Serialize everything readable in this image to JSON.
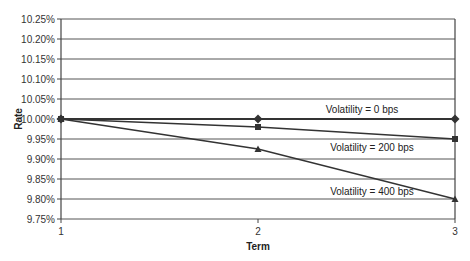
{
  "chart_data": {
    "type": "line",
    "title": "",
    "xlabel": "Term",
    "ylabel": "Rate",
    "x": [
      1,
      2,
      3
    ],
    "x_tick_labels": [
      "1",
      "2",
      "3"
    ],
    "y_tick_labels": [
      "9.75%",
      "9.80%",
      "9.85%",
      "9.90%",
      "9.95%",
      "10.00%",
      "10.05%",
      "10.10%",
      "10.15%",
      "10.20%",
      "10.25%"
    ],
    "ylim": [
      9.75,
      10.25
    ],
    "grid": true,
    "legend_position": "inline labels",
    "series": [
      {
        "name": "Volatility = 0 bps",
        "marker": "diamond",
        "values": [
          10.0,
          10.0,
          10.0
        ]
      },
      {
        "name": "Volatility = 200 bps",
        "marker": "square",
        "values": [
          10.0,
          9.98,
          9.95
        ]
      },
      {
        "name": "Volatility = 400 bps",
        "marker": "triangle",
        "values": [
          10.0,
          9.925,
          9.8
        ]
      }
    ]
  },
  "colors": {
    "line": "#333333",
    "grid": "#555555",
    "axis": "#444444"
  }
}
